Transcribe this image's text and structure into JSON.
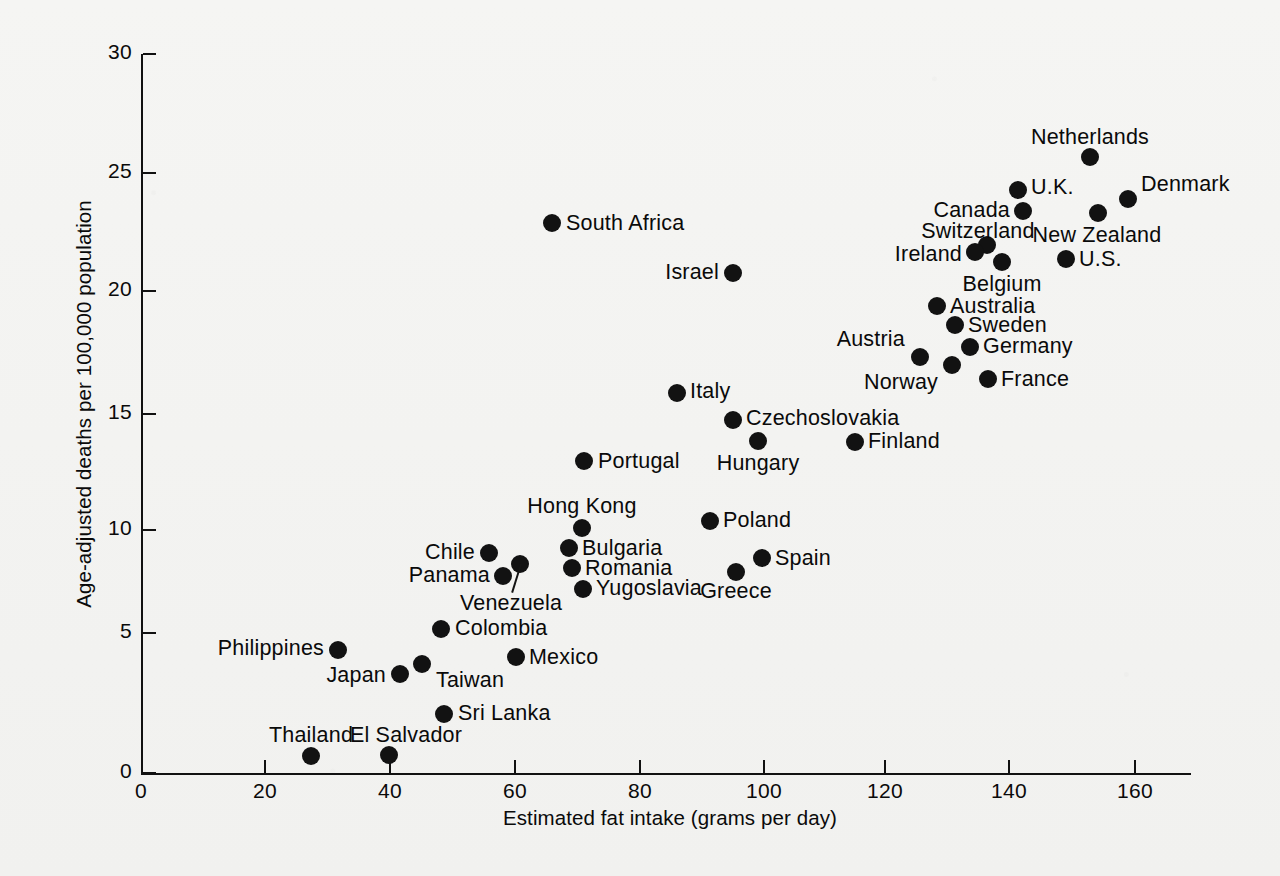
{
  "chart_data": {
    "type": "scatter",
    "title": "",
    "xlabel": "Estimated fat intake (grams per day)",
    "ylabel": "Age-adjusted deaths per 100,000 population",
    "xlim": [
      0,
      168
    ],
    "ylim": [
      0,
      30
    ],
    "xticks": [
      0,
      20,
      40,
      60,
      80,
      100,
      120,
      140,
      160
    ],
    "yticks": [
      0,
      5,
      10,
      15,
      20,
      25,
      30
    ],
    "grid": false,
    "legend": null,
    "marker": {
      "shape": "circle",
      "color": "#121212",
      "size_px": 18
    },
    "points": [
      {
        "label": "Netherlands",
        "x": 151.5,
        "y": 25.7,
        "px": 1090,
        "py": 157,
        "lab_px": 1090,
        "lab_py": 138,
        "anchor": "c"
      },
      {
        "label": "U.K.",
        "x": 141.5,
        "y": 24.4,
        "px": 1018,
        "py": 190,
        "lab_px": 1031,
        "lab_py": 188,
        "anchor": "r"
      },
      {
        "label": "Denmark",
        "x": 157.5,
        "y": 23.9,
        "px": 1128,
        "py": 199,
        "lab_px": 1141,
        "lab_py": 185,
        "anchor": "r"
      },
      {
        "label": "Canada",
        "x": 140.8,
        "y": 23.5,
        "px": 1023,
        "py": 211,
        "lab_px": 1010,
        "lab_py": 211,
        "anchor": "l"
      },
      {
        "label": "New Zealand",
        "x": 153.0,
        "y": 23.2,
        "px": 1098,
        "py": 213,
        "lab_px": 1097,
        "lab_py": 236,
        "anchor": "c"
      },
      {
        "label": "South Africa",
        "x": 65.6,
        "y": 22.8,
        "px": 552,
        "py": 223,
        "lab_px": 566,
        "lab_py": 224,
        "anchor": "r"
      },
      {
        "label": "Switzerland",
        "x": 135.0,
        "y": 21.8,
        "px": 987,
        "py": 245,
        "lab_px": 978,
        "lab_py": 232,
        "anchor": "c"
      },
      {
        "label": "Ireland",
        "x": 133.0,
        "y": 21.6,
        "px": 975,
        "py": 252,
        "lab_px": 962,
        "lab_py": 255,
        "anchor": "l"
      },
      {
        "label": "U.S.",
        "x": 147.5,
        "y": 21.2,
        "px": 1066,
        "py": 259,
        "lab_px": 1079,
        "lab_py": 260,
        "anchor": "r"
      },
      {
        "label": "Belgium",
        "x": 136.5,
        "y": 21.1,
        "px": 1002,
        "py": 262,
        "lab_px": 1002,
        "lab_py": 285,
        "anchor": "c"
      },
      {
        "label": "Israel",
        "x": 70.6,
        "y": 20.7,
        "px": 733,
        "py": 273,
        "lab_px": 719,
        "lab_py": 273,
        "anchor": "l"
      },
      {
        "label": "Australia",
        "x": 129.5,
        "y": 19.3,
        "px": 937,
        "py": 306,
        "lab_px": 950,
        "lab_py": 307,
        "anchor": "r"
      },
      {
        "label": "Sweden",
        "x": 132.0,
        "y": 18.5,
        "px": 955,
        "py": 325,
        "lab_px": 968,
        "lab_py": 326,
        "anchor": "r"
      },
      {
        "label": "Germany",
        "x": 134.5,
        "y": 17.6,
        "px": 970,
        "py": 347,
        "lab_px": 983,
        "lab_py": 347,
        "anchor": "r"
      },
      {
        "label": "Austria",
        "x": 86.0,
        "y": 17.2,
        "px": 920,
        "py": 357,
        "lab_px": 905,
        "lab_py": 340,
        "anchor": "l"
      },
      {
        "label": "Norway",
        "x": 131.5,
        "y": 16.8,
        "px": 952,
        "py": 365,
        "lab_px": 938,
        "lab_py": 383,
        "anchor": "l"
      },
      {
        "label": "France",
        "x": 139.5,
        "y": 16.2,
        "px": 988,
        "py": 379,
        "lab_px": 1001,
        "lab_py": 380,
        "anchor": "r"
      },
      {
        "label": "Italy",
        "x": 85.6,
        "y": 15.7,
        "px": 677,
        "py": 393,
        "lab_px": 690,
        "lab_py": 392,
        "anchor": "r"
      },
      {
        "label": "Czechoslovakia",
        "x": 94.6,
        "y": 14.7,
        "px": 733,
        "py": 420,
        "lab_px": 746,
        "lab_py": 419,
        "anchor": "r"
      },
      {
        "label": "Finland",
        "x": 114.0,
        "y": 13.6,
        "px": 855,
        "py": 442,
        "lab_px": 868,
        "lab_py": 442,
        "anchor": "r"
      },
      {
        "label": "Hungary",
        "x": 98.6,
        "y": 13.6,
        "px": 758,
        "py": 441,
        "lab_px": 758,
        "lab_py": 464,
        "anchor": "c"
      },
      {
        "label": "Portugal",
        "x": 70.0,
        "y": 12.8,
        "px": 584,
        "py": 461,
        "lab_px": 598,
        "lab_py": 462,
        "anchor": "r"
      },
      {
        "label": "Poland",
        "x": 90.6,
        "y": 10.3,
        "px": 710,
        "py": 521,
        "lab_px": 723,
        "lab_py": 521,
        "anchor": "r"
      },
      {
        "label": "Hong Kong",
        "x": 70.5,
        "y": 10.1,
        "px": 582,
        "py": 528,
        "lab_px": 582,
        "lab_py": 507,
        "anchor": "c"
      },
      {
        "label": "Bulgaria",
        "x": 69.0,
        "y": 9.0,
        "px": 569,
        "py": 548,
        "lab_px": 582,
        "lab_py": 549,
        "anchor": "r"
      },
      {
        "label": "Chile",
        "x": 55.7,
        "y": 8.8,
        "px": 489,
        "py": 553,
        "lab_px": 475,
        "lab_py": 553,
        "anchor": "l"
      },
      {
        "label": "Spain",
        "x": 99.5,
        "y": 8.6,
        "px": 762,
        "py": 558,
        "lab_px": 775,
        "lab_py": 559,
        "anchor": "r"
      },
      {
        "label": "Venezuela",
        "x": 60.5,
        "y": 8.4,
        "px": 520,
        "py": 564,
        "lab_px": 511,
        "lab_py": 604,
        "anchor": "c"
      },
      {
        "label": "Romania",
        "x": 69.5,
        "y": 8.2,
        "px": 572,
        "py": 568,
        "lab_px": 585,
        "lab_py": 569,
        "anchor": "r"
      },
      {
        "label": "Greece",
        "x": 95.0,
        "y": 8.0,
        "px": 736,
        "py": 572,
        "lab_px": 736,
        "lab_py": 592,
        "anchor": "c"
      },
      {
        "label": "Panama",
        "x": 58.0,
        "y": 7.9,
        "px": 503,
        "py": 576,
        "lab_px": 490,
        "lab_py": 576,
        "anchor": "l"
      },
      {
        "label": "Yugoslavia",
        "x": 71.5,
        "y": 7.2,
        "px": 583,
        "py": 589,
        "lab_px": 596,
        "lab_py": 589,
        "anchor": "r"
      },
      {
        "label": "Colombia",
        "x": 48.0,
        "y": 5.2,
        "px": 441,
        "py": 629,
        "lab_px": 455,
        "lab_py": 629,
        "anchor": "r"
      },
      {
        "label": "Philippines",
        "x": 31.4,
        "y": 4.4,
        "px": 338,
        "py": 650,
        "lab_px": 324,
        "lab_py": 649,
        "anchor": "l"
      },
      {
        "label": "Mexico",
        "x": 60.0,
        "y": 4.0,
        "px": 516,
        "py": 657,
        "lab_px": 529,
        "lab_py": 658,
        "anchor": "r"
      },
      {
        "label": "Taiwan",
        "x": 44.0,
        "y": 3.8,
        "px": 422,
        "py": 664,
        "lab_px": 436,
        "lab_py": 681,
        "anchor": "r"
      },
      {
        "label": "Japan",
        "x": 41.0,
        "y": 3.4,
        "px": 400,
        "py": 674,
        "lab_px": 386,
        "lab_py": 676,
        "anchor": "l"
      },
      {
        "label": "Sri Lanka",
        "x": 48.5,
        "y": 2.0,
        "px": 444,
        "py": 714,
        "lab_px": 458,
        "lab_py": 714,
        "anchor": "r"
      },
      {
        "label": "Thailand",
        "x": 27.3,
        "y": 0.8,
        "px": 311,
        "py": 756,
        "lab_px": 311,
        "lab_py": 736,
        "anchor": "c"
      },
      {
        "label": "El Salvador",
        "x": 39.7,
        "y": 0.8,
        "px": 389,
        "py": 755,
        "lab_px": 406,
        "lab_py": 736,
        "anchor": "c"
      }
    ]
  },
  "axes": {
    "x_title": "Estimated fat intake (grams per day)",
    "y_title": "Age-adjusted deaths per 100,000 population",
    "x_tick_labels": [
      "0",
      "20",
      "40",
      "60",
      "80",
      "100",
      "120",
      "140",
      "160"
    ],
    "y_tick_labels": [
      "0",
      "5",
      "10",
      "15",
      "20",
      "25",
      "30"
    ],
    "x_tick_px": [
      141,
      265,
      390,
      515,
      640,
      764,
      885,
      1009,
      1135
    ],
    "y_tick_px": [
      773,
      633,
      530,
      414,
      291,
      173,
      54
    ],
    "axis_color": "#111111"
  },
  "colors": {
    "background": "#f4f4f2",
    "ink": "#111111",
    "marker": "#121212"
  }
}
